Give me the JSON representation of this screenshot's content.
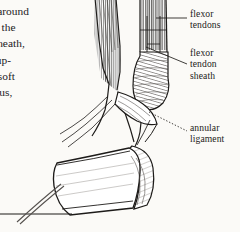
{
  "page": {
    "background_color": "#fbfaf7",
    "ink_color": "#1d1b19"
  },
  "body_text": {
    "note": "Left-hand body column, clipped by the left page edge",
    "lines": [
      "os around",
      "ing the",
      "n sheath,",
      "s sup-",
      "ed soft",
      "orous,"
    ],
    "partial_last_line": "t"
  },
  "figure": {
    "caption": "",
    "style": "pen-and-ink line engraving with hatching"
  },
  "labels": [
    {
      "id": "flexor-tendons",
      "lines": [
        "flexor",
        "tendons"
      ],
      "leader": "straight horizontal line"
    },
    {
      "id": "flexor-tendon-sheath",
      "lines": [
        "flexor",
        "tendon",
        "sheath"
      ],
      "leader": "straight diagonal line"
    },
    {
      "id": "annular-ligament",
      "lines": [
        "annular",
        "ligament"
      ],
      "leader": "dotted diagonal line"
    }
  ]
}
